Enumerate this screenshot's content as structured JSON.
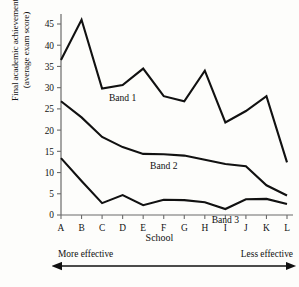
{
  "chart_data": {
    "type": "line",
    "title": "",
    "xlabel": "School",
    "ylabel": "Final academic achievement (average exam score)",
    "ylabel_line1": "Final academic achievement",
    "ylabel_line2": "(average exam score)",
    "categories": [
      "A",
      "B",
      "C",
      "D",
      "E",
      "F",
      "G",
      "H",
      "I",
      "J",
      "K",
      "L"
    ],
    "yticks": [
      0,
      5,
      10,
      15,
      20,
      25,
      30,
      35,
      40,
      45
    ],
    "ylim": [
      0,
      48
    ],
    "grid": false,
    "legend_position": "inline-labels",
    "series": [
      {
        "name": "Band 1",
        "label_x_category": "D",
        "values": [
          36.5,
          46.0,
          29.8,
          30.6,
          34.5,
          28.0,
          26.8,
          34.0,
          21.8,
          24.5,
          28.0,
          12.4
        ]
      },
      {
        "name": "Band 2",
        "label_x_category": "F",
        "values": [
          26.8,
          23.0,
          18.4,
          16.0,
          14.4,
          14.3,
          14.0,
          13.0,
          12.0,
          11.5,
          7.0,
          4.6
        ]
      },
      {
        "name": "Band 3",
        "label_x_category": "I",
        "values": [
          13.4,
          8.0,
          2.8,
          4.7,
          2.3,
          3.6,
          3.5,
          3.0,
          1.4,
          3.7,
          3.8,
          2.6
        ]
      }
    ],
    "annotations": {
      "left_label": "More effective",
      "right_label": "Less effective",
      "arrow": "double-headed-horizontal"
    },
    "colors": {
      "line": "#111111",
      "axis": "#555555",
      "background": "#fdfdfb"
    }
  }
}
